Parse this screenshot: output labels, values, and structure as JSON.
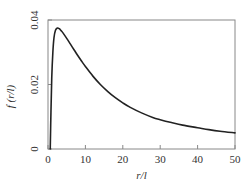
{
  "chart_data": {
    "type": "line",
    "title": "",
    "xlabel": "r/l",
    "ylabel": "f (r/l)",
    "xlim": [
      0,
      50
    ],
    "ylim": [
      0,
      0.04
    ],
    "grid": false,
    "legend": null,
    "x_ticks": [
      0,
      10,
      20,
      30,
      40,
      50
    ],
    "x_tick_labels": [
      "0",
      "10",
      "20",
      "30",
      "40",
      "50"
    ],
    "y_ticks": [
      0,
      0.02,
      0.04
    ],
    "y_tick_labels": [
      "0",
      "0.02",
      "0.04"
    ],
    "series": [
      {
        "name": "f(r/l)",
        "color": "#222222",
        "x": [
          0.6,
          0.8,
          1.0,
          1.3,
          1.6,
          2.0,
          2.5,
          3.0,
          3.5,
          4,
          5,
          6,
          7,
          8,
          9,
          10,
          12,
          14,
          16,
          18,
          20,
          22,
          25,
          28,
          30,
          33,
          36,
          40,
          43,
          46,
          50
        ],
        "y": [
          0.0,
          0.012,
          0.022,
          0.03,
          0.0345,
          0.0368,
          0.0375,
          0.0373,
          0.0367,
          0.036,
          0.0343,
          0.0325,
          0.0307,
          0.0289,
          0.0272,
          0.0256,
          0.0226,
          0.02,
          0.0178,
          0.0159,
          0.0143,
          0.0129,
          0.0112,
          0.0098,
          0.0091,
          0.0082,
          0.0074,
          0.0066,
          0.006,
          0.0055,
          0.005
        ]
      }
    ]
  },
  "plot": {
    "left": 48,
    "right": 235,
    "top": 20,
    "bottom": 149,
    "frame_color": "#888888",
    "line_color": "#222222"
  }
}
